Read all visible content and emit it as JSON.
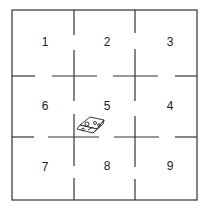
{
  "diagram": {
    "type": "grid-of-cells",
    "line_color": "#333333",
    "cells": [
      {
        "label": "1",
        "x": 45,
        "y": 46
      },
      {
        "label": "2",
        "x": 107,
        "y": 46
      },
      {
        "label": "3",
        "x": 170,
        "y": 46
      },
      {
        "label": "6",
        "x": 45,
        "y": 110
      },
      {
        "label": "5",
        "x": 107,
        "y": 110
      },
      {
        "label": "4",
        "x": 170,
        "y": 110
      },
      {
        "label": "7",
        "x": 45,
        "y": 171
      },
      {
        "label": "8",
        "x": 107,
        "y": 170
      },
      {
        "label": "9",
        "x": 170,
        "y": 170
      }
    ],
    "object": {
      "name": "robot",
      "cell": "5"
    }
  }
}
